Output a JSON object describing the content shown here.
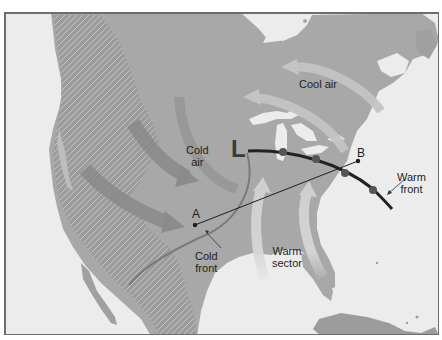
{
  "map": {
    "title": "Mid-latitude cyclone over North America",
    "low_pressure_symbol": "L",
    "labels": {
      "cold_air": [
        "Cold",
        "air"
      ],
      "cool_air": "Cool air",
      "warm_sector": [
        "Warm",
        "sector"
      ],
      "warm_front": [
        "Warm",
        "front"
      ],
      "cold_front": [
        "Cold",
        "front"
      ]
    },
    "points": {
      "a": "A",
      "b": "B"
    },
    "colors": {
      "ocean": "#ececec",
      "land": "#a9a9a9",
      "mountains": "#8e8e8e",
      "cold_arrow": "#8c8c8c",
      "warm_arrow": "#cfcfcf",
      "front_line": "#2a2a2a",
      "frame": "#6e6e6e"
    },
    "features": [
      {
        "type": "low-pressure-center",
        "label": "L"
      },
      {
        "type": "cold-front",
        "label": "Cold front"
      },
      {
        "type": "warm-front",
        "label": "Warm front"
      },
      {
        "type": "cross-section-line",
        "from": "A",
        "to": "B"
      },
      {
        "type": "airflow",
        "label": "Cold air"
      },
      {
        "type": "airflow",
        "label": "Cool air"
      },
      {
        "type": "airflow",
        "label": "Warm sector"
      }
    ]
  }
}
